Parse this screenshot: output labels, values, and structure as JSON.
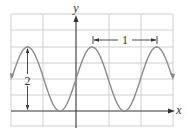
{
  "figure": {
    "labels": {
      "x_axis": "x",
      "y_axis": "y",
      "period": "1",
      "peak_to_trough": "2"
    },
    "colors": {
      "grid": "#cfcfcf",
      "axes": "#333333",
      "curve": "#8a8a8a",
      "annotation": "#333333"
    }
  },
  "chart_data": {
    "type": "line",
    "title": "",
    "xlabel": "x",
    "ylabel": "y",
    "function": "y = 1 + sin(2*pi*x)",
    "xlim": [
      -1.0,
      1.5
    ],
    "ylim": [
      -0.5,
      3.0
    ],
    "grid": true,
    "grid_spacing": {
      "x": 0.5,
      "y": 0.5
    },
    "amplitude": 1,
    "period": 1,
    "midline": 1,
    "max": 2,
    "min": 0,
    "peaks_x": [
      -0.75,
      0.25,
      1.25
    ],
    "troughs_x": [
      -0.25,
      0.75
    ],
    "annotations": [
      {
        "type": "double-arrow-vertical",
        "label": "2",
        "from": [
          -0.75,
          0
        ],
        "to": [
          -0.75,
          2
        ]
      },
      {
        "type": "bracket-horizontal",
        "label": "1",
        "from": [
          0.25,
          2.3
        ],
        "to": [
          1.25,
          2.3
        ]
      }
    ]
  }
}
